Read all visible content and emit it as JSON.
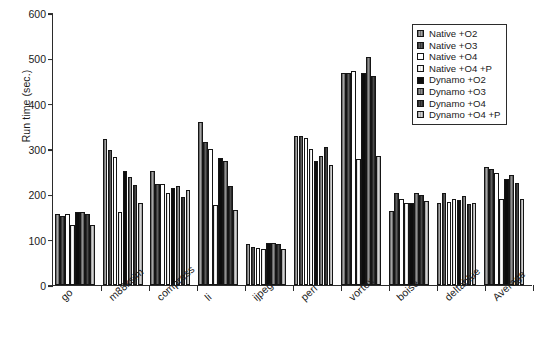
{
  "chart_data": {
    "type": "bar",
    "title": "",
    "xlabel": "",
    "ylabel": "Run time (sec.)",
    "ylim": [
      0,
      600
    ],
    "yticks": [
      0,
      100,
      200,
      300,
      400,
      500,
      600
    ],
    "ytick_labels": [
      "0",
      "100",
      "200",
      "300",
      "400",
      "500",
      "600"
    ],
    "grid": false,
    "legend_position": "top-right",
    "categories": [
      "go",
      "m88ksim",
      "compress",
      "li",
      "ijpeg",
      "perl",
      "vortex",
      "boise",
      "deltablue",
      "Average"
    ],
    "series": [
      {
        "name": "Native +O2",
        "color": "#8d8d8d",
        "values": [
          157,
          321,
          252,
          360,
          91,
          328,
          467,
          164,
          182,
          260
        ]
      },
      {
        "name": "Native +O3",
        "color": "#4e4e4e",
        "values": [
          152,
          297,
          222,
          316,
          83,
          328,
          467,
          202,
          203,
          255
        ]
      },
      {
        "name": "Native +O4",
        "color": "#ffffff",
        "values": [
          157,
          283,
          222,
          301,
          82,
          324,
          473,
          190,
          183,
          247
        ]
      },
      {
        "name": "Native +O4 +P",
        "color": "#f2f2f2",
        "values": [
          133,
          161,
          202,
          177,
          80,
          300,
          279,
          182,
          190,
          190
        ]
      },
      {
        "name": "Dynamo +O2",
        "color": "#0d0d0d",
        "values": [
          162,
          251,
          215,
          281,
          93,
          274,
          467,
          180,
          187,
          233
        ]
      },
      {
        "name": "Dynamo +O3",
        "color": "#7a7a7a",
        "values": [
          161,
          239,
          218,
          274,
          93,
          285,
          504,
          203,
          196,
          242
        ]
      },
      {
        "name": "Dynamo +O4",
        "color": "#3a3a3a",
        "values": [
          157,
          220,
          195,
          218,
          91,
          305,
          460,
          199,
          178,
          226
        ]
      },
      {
        "name": "Dynamo +O4 +P",
        "color": "#bdbdbd",
        "values": [
          133,
          181,
          210,
          165,
          80,
          264,
          285,
          185,
          181,
          189
        ]
      }
    ]
  }
}
